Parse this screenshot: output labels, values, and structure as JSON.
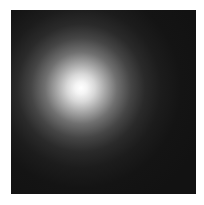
{
  "image": {
    "description": "Blurred bright white point light / Gaussian spot on a dark square background",
    "background_color": "#121212",
    "glow_center_color": "#ffffff",
    "border_color": "#ffffff"
  }
}
